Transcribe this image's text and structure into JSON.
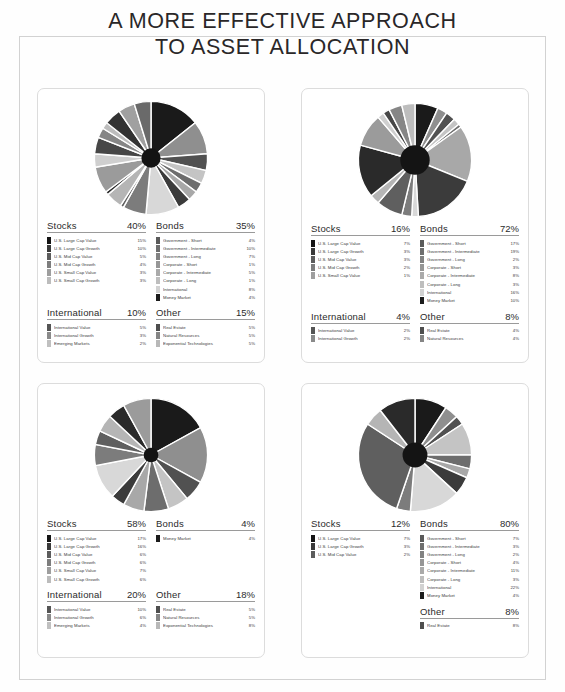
{
  "title": {
    "line1": "A MORE EFFECTIVE APPROACH",
    "line2": "TO ASSET ALLOCATION"
  },
  "colors": {
    "swatch_dark": "#1c1c1c",
    "swatch_mid": "#6e6e6e",
    "swatch_light": "#c8c8c8",
    "border": "#dcdcdc",
    "rule": "#9a9a9a",
    "text": "#3a3a3a"
  },
  "chart_data": [
    {
      "type": "pie",
      "title": "Portfolio 1",
      "donut_hole": 0.17,
      "labels": [
        "U.S. Large Cap Value",
        "U.S. Large Cap Growth",
        "U.S. Mid Cap Value",
        "U.S. Mid Cap Growth",
        "U.S. Small Cap Value",
        "U.S. Small Cap Growth",
        "Government - Short",
        "Government - Intermediate",
        "Government - Long",
        "Corporate - Short",
        "Corporate - Intermediate",
        "Corporate - Long",
        "International",
        "Money Market",
        "International Value",
        "International Growth",
        "Emerging Markets",
        "Real Estate",
        "Natural Resources",
        "Exponential Technologies"
      ],
      "values": [
        15,
        10,
        5,
        4,
        3,
        3,
        4,
        10,
        7,
        1,
        5,
        1,
        8,
        4,
        5,
        3,
        2,
        5,
        5,
        5
      ]
    },
    {
      "type": "pie",
      "title": "Portfolio 2",
      "donut_hole": 0.26,
      "labels": [
        "U.S. Large Cap Value",
        "U.S. Large Cap Growth",
        "U.S. Mid Cap Value",
        "U.S. Mid Cap Growth",
        "U.S. Small Cap Value",
        "Government - Short",
        "Government - Intermediate",
        "Government - Long",
        "Corporate - Short",
        "Corporate - Intermediate",
        "Corporate - Long",
        "International",
        "Money Market",
        "International Value",
        "International Growth",
        "Real Estate",
        "Natural Resources"
      ],
      "values": [
        7,
        3,
        3,
        2,
        1,
        17,
        19,
        2,
        3,
        8,
        3,
        16,
        10,
        2,
        2,
        4,
        4
      ]
    },
    {
      "type": "pie",
      "title": "Portfolio 3",
      "donut_hole": 0.13,
      "labels": [
        "U.S. Large Cap Value",
        "U.S. Large Cap Growth",
        "U.S. Mid Cap Value",
        "U.S. Mid Cap Growth",
        "U.S. Small Cap Value",
        "U.S. Small Cap Growth",
        "Money Market",
        "International Value",
        "International Growth",
        "Emerging Markets",
        "Real Estate",
        "Natural Resources",
        "Exponential Technologies"
      ],
      "values": [
        17,
        16,
        6,
        6,
        7,
        6,
        4,
        10,
        6,
        4,
        5,
        5,
        8
      ]
    },
    {
      "type": "pie",
      "title": "Portfolio 4",
      "donut_hole": 0.22,
      "labels": [
        "U.S. Large Cap Value",
        "U.S. Large Cap Growth",
        "U.S. Mid Cap Value",
        "Government - Short",
        "Government - Intermediate",
        "Government - Long",
        "Corporate - Short",
        "Corporate - Intermediate",
        "Corporate - Long",
        "International",
        "Money Market",
        "Real Estate"
      ],
      "values": [
        7,
        3,
        2,
        7,
        3,
        2,
        4,
        11,
        3,
        22,
        4,
        8
      ]
    }
  ],
  "cards": [
    {
      "id": "portfolio-1",
      "sections": [
        {
          "name": "Stocks",
          "pct": "40%",
          "rows": [
            {
              "label": "U.S. Large Cap Value",
              "value": "15%",
              "color": "#141414"
            },
            {
              "label": "U.S. Large Cap Growth",
              "value": "10%",
              "color": "#3a3a3a"
            },
            {
              "label": "U.S. Mid Cap Value",
              "value": "5%",
              "color": "#5c5c5c"
            },
            {
              "label": "U.S. Mid Cap Growth",
              "value": "4%",
              "color": "#7d7d7d"
            },
            {
              "label": "U.S. Small Cap Value",
              "value": "3%",
              "color": "#9e9e9e"
            },
            {
              "label": "U.S. Small Cap Growth",
              "value": "3%",
              "color": "#bcbcbc"
            }
          ]
        },
        {
          "name": "Bonds",
          "pct": "35%",
          "rows": [
            {
              "label": "Government - Short",
              "value": "4%",
              "color": "#5a5a5a"
            },
            {
              "label": "Government - Intermediate",
              "value": "10%",
              "color": "#6e6e6e"
            },
            {
              "label": "Government - Long",
              "value": "7%",
              "color": "#828282"
            },
            {
              "label": "Corporate - Short",
              "value": "1%",
              "color": "#969696"
            },
            {
              "label": "Corporate - Intermediate",
              "value": "5%",
              "color": "#aaaaaa"
            },
            {
              "label": "Corporate - Long",
              "value": "1%",
              "color": "#bebebe"
            },
            {
              "label": "International",
              "value": "8%",
              "color": "#d2d2d2"
            },
            {
              "label": "Money Market",
              "value": "4%",
              "color": "#1c1c1c"
            }
          ]
        },
        {
          "name": "International",
          "pct": "10%",
          "rows": [
            {
              "label": "International Value",
              "value": "5%",
              "color": "#555555"
            },
            {
              "label": "International Growth",
              "value": "3%",
              "color": "#8a8a8a"
            },
            {
              "label": "Emerging Markets",
              "value": "2%",
              "color": "#c0c0c0"
            }
          ]
        },
        {
          "name": "Other",
          "pct": "15%",
          "rows": [
            {
              "label": "Real Estate",
              "value": "5%",
              "color": "#4e4e4e"
            },
            {
              "label": "Natural Resources",
              "value": "5%",
              "color": "#858585"
            },
            {
              "label": "Exponential Technologies",
              "value": "5%",
              "color": "#b8b8b8"
            }
          ]
        }
      ]
    },
    {
      "id": "portfolio-2",
      "sections": [
        {
          "name": "Stocks",
          "pct": "16%",
          "rows": [
            {
              "label": "U.S. Large Cap Value",
              "value": "7%",
              "color": "#141414"
            },
            {
              "label": "U.S. Large Cap Growth",
              "value": "3%",
              "color": "#3a3a3a"
            },
            {
              "label": "U.S. Mid Cap Value",
              "value": "3%",
              "color": "#5c5c5c"
            },
            {
              "label": "U.S. Mid Cap Growth",
              "value": "2%",
              "color": "#7d7d7d"
            },
            {
              "label": "U.S. Small Cap Value",
              "value": "1%",
              "color": "#9e9e9e"
            }
          ]
        },
        {
          "name": "Bonds",
          "pct": "72%",
          "rows": [
            {
              "label": "Government - Short",
              "value": "17%",
              "color": "#5a5a5a"
            },
            {
              "label": "Government - Intermediate",
              "value": "19%",
              "color": "#6e6e6e"
            },
            {
              "label": "Government - Long",
              "value": "2%",
              "color": "#828282"
            },
            {
              "label": "Corporate - Short",
              "value": "3%",
              "color": "#969696"
            },
            {
              "label": "Corporate - Intermediate",
              "value": "8%",
              "color": "#aaaaaa"
            },
            {
              "label": "Corporate - Long",
              "value": "3%",
              "color": "#bebebe"
            },
            {
              "label": "International",
              "value": "16%",
              "color": "#d2d2d2"
            },
            {
              "label": "Money Market",
              "value": "10%",
              "color": "#1c1c1c"
            }
          ]
        },
        {
          "name": "International",
          "pct": "4%",
          "rows": [
            {
              "label": "International Value",
              "value": "2%",
              "color": "#555555"
            },
            {
              "label": "International Growth",
              "value": "2%",
              "color": "#8a8a8a"
            }
          ]
        },
        {
          "name": "Other",
          "pct": "8%",
          "rows": [
            {
              "label": "Real Estate",
              "value": "4%",
              "color": "#4e4e4e"
            },
            {
              "label": "Natural Resources",
              "value": "4%",
              "color": "#858585"
            }
          ]
        }
      ]
    },
    {
      "id": "portfolio-3",
      "sections": [
        {
          "name": "Stocks",
          "pct": "58%",
          "rows": [
            {
              "label": "U.S. Large Cap Value",
              "value": "17%",
              "color": "#141414"
            },
            {
              "label": "U.S. Large Cap Growth",
              "value": "16%",
              "color": "#3a3a3a"
            },
            {
              "label": "U.S. Mid Cap Value",
              "value": "6%",
              "color": "#5c5c5c"
            },
            {
              "label": "U.S. Mid Cap Growth",
              "value": "6%",
              "color": "#7d7d7d"
            },
            {
              "label": "U.S. Small Cap Value",
              "value": "7%",
              "color": "#9e9e9e"
            },
            {
              "label": "U.S. Small Cap Growth",
              "value": "6%",
              "color": "#bcbcbc"
            }
          ]
        },
        {
          "name": "Bonds",
          "pct": "4%",
          "rows": [
            {
              "label": "Money Market",
              "value": "4%",
              "color": "#1c1c1c"
            }
          ]
        },
        {
          "name": "International",
          "pct": "20%",
          "rows": [
            {
              "label": "International Value",
              "value": "10%",
              "color": "#555555"
            },
            {
              "label": "International Growth",
              "value": "6%",
              "color": "#8a8a8a"
            },
            {
              "label": "Emerging Markets",
              "value": "4%",
              "color": "#c0c0c0"
            }
          ]
        },
        {
          "name": "Other",
          "pct": "18%",
          "rows": [
            {
              "label": "Real Estate",
              "value": "5%",
              "color": "#4e4e4e"
            },
            {
              "label": "Natural Resources",
              "value": "5%",
              "color": "#858585"
            },
            {
              "label": "Exponential Technologies",
              "value": "8%",
              "color": "#b8b8b8"
            }
          ]
        }
      ]
    },
    {
      "id": "portfolio-4",
      "sections": [
        {
          "name": "Stocks",
          "pct": "12%",
          "rows": [
            {
              "label": "U.S. Large Cap Value",
              "value": "7%",
              "color": "#141414"
            },
            {
              "label": "U.S. Large Cap Growth",
              "value": "3%",
              "color": "#3a3a3a"
            },
            {
              "label": "U.S. Mid Cap Value",
              "value": "2%",
              "color": "#5c5c5c"
            }
          ]
        },
        {
          "name": "Bonds",
          "pct": "80%",
          "rows": [
            {
              "label": "Government - Short",
              "value": "7%",
              "color": "#5a5a5a"
            },
            {
              "label": "Government - Intermediate",
              "value": "3%",
              "color": "#6e6e6e"
            },
            {
              "label": "Government - Long",
              "value": "2%",
              "color": "#828282"
            },
            {
              "label": "Corporate - Short",
              "value": "4%",
              "color": "#969696"
            },
            {
              "label": "Corporate - Intermediate",
              "value": "11%",
              "color": "#aaaaaa"
            },
            {
              "label": "Corporate - Long",
              "value": "3%",
              "color": "#bebebe"
            },
            {
              "label": "International",
              "value": "22%",
              "color": "#d2d2d2"
            },
            {
              "label": "Money Market",
              "value": "4%",
              "color": "#1c1c1c"
            }
          ]
        },
        {
          "name": "Other",
          "pct": "8%",
          "rows": [
            {
              "label": "Real Estate",
              "value": "8%",
              "color": "#4e4e4e"
            }
          ]
        }
      ]
    }
  ]
}
